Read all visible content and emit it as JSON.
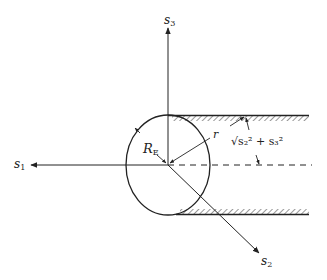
{
  "diagram": {
    "axes": {
      "s1": {
        "label": "s",
        "sub": "1"
      },
      "s2": {
        "label": "s",
        "sub": "2"
      },
      "s3": {
        "label": "s",
        "sub": "3"
      }
    },
    "labels": {
      "radius_earth": {
        "label": "R",
        "sub": "E"
      },
      "r": "r",
      "cylinder_radius": "√s₂² + s₃²"
    },
    "colors": {
      "line": "#222222",
      "background": "#ffffff"
    }
  }
}
